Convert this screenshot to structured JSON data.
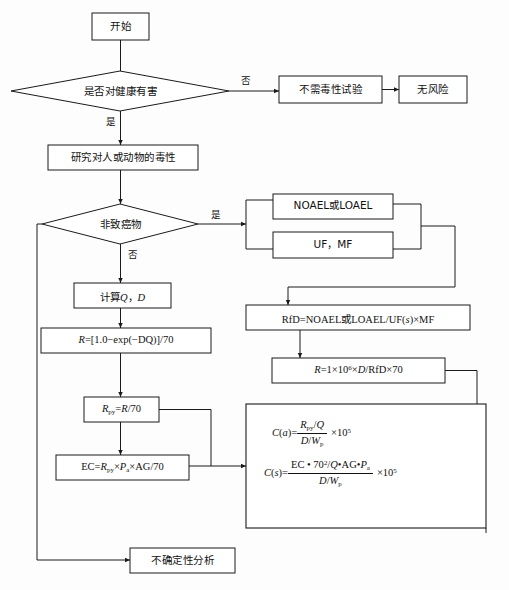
{
  "diagram": {
    "type": "flowchart",
    "orientation": "top-to-bottom",
    "colors": {
      "stroke": "#1a1a1a",
      "fill": "#ffffff",
      "background": "#fdfdfd",
      "text": "#111111"
    }
  },
  "nodes": {
    "start": {
      "label": "开始",
      "shape": "rectangle"
    },
    "decision_health_harm": {
      "label": "是否对健康有害",
      "shape": "diamond"
    },
    "no_tox_test": {
      "label": "不需毒性试验",
      "shape": "rectangle"
    },
    "no_risk": {
      "label": "无风险",
      "shape": "rectangle"
    },
    "study_toxicity": {
      "label": "研究对人或动物的毒性",
      "shape": "rectangle"
    },
    "decision_noncarcinogen": {
      "label": "非致癌物",
      "shape": "diamond"
    },
    "noael_loael": {
      "label": "NOAEL或LOAEL",
      "shape": "rectangle"
    },
    "uf_mf": {
      "label": "UF，MF",
      "shape": "rectangle"
    },
    "rfd_formula": {
      "label": "RfD=NOAEL或LOAEL/UF(s)×MF",
      "shape": "rectangle"
    },
    "r_rfd_formula": {
      "label": "R =1×10⁶×D/RfD×70",
      "shape": "rectangle"
    },
    "calc_qd": {
      "label": "计算Q，D",
      "shape": "rectangle"
    },
    "r_exp_formula": {
      "label": "R =[1.0−exp(−DQ)]/70",
      "shape": "rectangle"
    },
    "rpy_formula": {
      "label": "Rₚᵧ=R/70",
      "shape": "rectangle"
    },
    "ec_formula": {
      "label": "EC=Rₚᵧ×Pₐ×AG/70",
      "shape": "rectangle"
    },
    "concentration_box": {
      "label": "C(a) 和 C(s) 浓度计算",
      "shape": "rectangle"
    },
    "uncertainty": {
      "label": "不确定性分析",
      "shape": "rectangle"
    }
  },
  "edge_labels": {
    "health_harm_no": "否",
    "health_harm_yes": "是",
    "noncarcinogen_yes": "是",
    "noncarcinogen_no": "否"
  },
  "formulas": {
    "rfd": {
      "lhs": "RfD=NOAEL",
      "cjk_or": "或",
      "rhs": "LOAEL/UF(",
      "var_s": "s",
      "tail": ")×MF"
    },
    "r_from_rfd": {
      "var_r": "R",
      "eq": "=1×10",
      "exp": "6",
      "mid": "×",
      "var_d": "D",
      "tail": "/RfD×70"
    },
    "calc_qd": {
      "prefix": "计算",
      "var_q": "Q",
      "comma": "，",
      "var_d": "D"
    },
    "r_exp": {
      "var_r": "R",
      "body": "=[1.0−exp(−DQ)]/70"
    },
    "rpy": {
      "var_r": "R",
      "sub": "py",
      "eq": "=",
      "var_r2": "R",
      "tail": "/70"
    },
    "ec": {
      "prefix": "EC=",
      "var_r": "R",
      "sub_py": "py",
      "times1": "×",
      "var_p": "P",
      "sub_a": "a",
      "times2": "×",
      "tail": "AG/70"
    },
    "c_a": {
      "lhs_fn": "C",
      "lhs_arg": "a",
      "eq": "=",
      "num_r": "R",
      "num_sub": "py",
      "num_slash": "/",
      "num_q": "Q",
      "den_d": "D",
      "den_slash": "/",
      "den_w": "W",
      "den_sub": "p",
      "times": "×10",
      "exp": "5"
    },
    "c_s": {
      "lhs_fn": "C",
      "lhs_arg": "s",
      "eq": "=",
      "num_ec": "EC • 70",
      "num_exp": "2",
      "num_mid": "/",
      "num_q": "Q",
      "num_dot1": "•",
      "num_ag": "AG",
      "num_dot2": "•",
      "num_p": "P",
      "num_p_sub": "a",
      "den_d": "D",
      "den_slash": "/",
      "den_w": "W",
      "den_sub": "p",
      "times": "×10",
      "exp": "5"
    }
  }
}
